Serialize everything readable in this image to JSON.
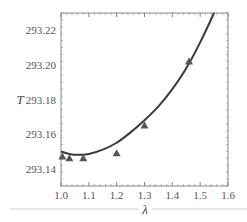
{
  "chart_data": {
    "type": "line",
    "title": "",
    "xlabel": "λ",
    "ylabel": "T",
    "xlim": [
      1.0,
      1.6
    ],
    "ylim": [
      293.13,
      293.23
    ],
    "xticks": [
      1.0,
      1.1,
      1.2,
      1.3,
      1.4,
      1.5,
      1.6
    ],
    "xtick_labels": [
      "1.0",
      "1.1",
      "1.2",
      "1.3",
      "1.4",
      "1.5",
      "1.6"
    ],
    "yticks": [
      293.14,
      293.16,
      293.18,
      293.2,
      293.22
    ],
    "ytick_labels": [
      "293.14",
      "293.16",
      "293.18",
      "293.20",
      "293.22"
    ],
    "grid": false,
    "legend": null,
    "series": [
      {
        "name": "model curve",
        "kind": "line",
        "color": "#3a3a3a",
        "x": [
          1.0,
          1.03,
          1.06,
          1.1,
          1.15,
          1.2,
          1.25,
          1.3,
          1.35,
          1.4,
          1.45,
          1.5,
          1.55
        ],
        "y": [
          293.15,
          293.1485,
          293.148,
          293.1485,
          293.151,
          293.155,
          293.161,
          293.168,
          293.176,
          293.186,
          293.198,
          293.213,
          293.23
        ]
      },
      {
        "name": "measured",
        "kind": "scatter",
        "marker": "triangle",
        "color": "#555555",
        "x": [
          1.005,
          1.03,
          1.08,
          1.2,
          1.3,
          1.46
        ],
        "y": [
          293.147,
          293.146,
          293.146,
          293.149,
          293.165,
          293.202
        ]
      }
    ]
  }
}
